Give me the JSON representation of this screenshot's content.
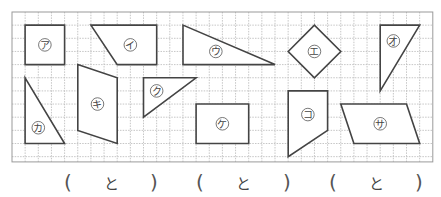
{
  "worksheet": {
    "grid": {
      "cols": 32,
      "rows": 11.4,
      "line_color": "#b8b8b8",
      "border_color": "#9a9a9a"
    },
    "shape_stroke": "#444444",
    "shapes": [
      {
        "label": "ア",
        "points": [
          [
            1,
            1
          ],
          [
            4,
            1
          ],
          [
            4,
            4
          ],
          [
            1,
            4
          ]
        ],
        "label_at": [
          2.5,
          2.5
        ]
      },
      {
        "label": "イ",
        "points": [
          [
            6,
            1
          ],
          [
            11,
            1
          ],
          [
            11,
            4
          ],
          [
            8,
            4
          ]
        ],
        "label_at": [
          9,
          2.5
        ]
      },
      {
        "label": "ウ",
        "points": [
          [
            13,
            1
          ],
          [
            13,
            4
          ],
          [
            20,
            4
          ]
        ],
        "label_at": [
          15.5,
          3
        ]
      },
      {
        "label": "エ",
        "points": [
          [
            21,
            3
          ],
          [
            23,
            1
          ],
          [
            25,
            3
          ],
          [
            23,
            5
          ]
        ],
        "label_at": [
          23,
          3
        ]
      },
      {
        "label": "オ",
        "points": [
          [
            28,
            1
          ],
          [
            31,
            1
          ],
          [
            28,
            6
          ]
        ],
        "label_at": [
          29,
          2.2
        ]
      },
      {
        "label": "カ",
        "points": [
          [
            1,
            5
          ],
          [
            1,
            10
          ],
          [
            4,
            10
          ]
        ],
        "label_at": [
          2,
          8.8
        ]
      },
      {
        "label": "キ",
        "points": [
          [
            5,
            4
          ],
          [
            8,
            5
          ],
          [
            8,
            10
          ],
          [
            5,
            9
          ]
        ],
        "label_at": [
          6.5,
          7
        ]
      },
      {
        "label": "ク",
        "points": [
          [
            10,
            5
          ],
          [
            14,
            5
          ],
          [
            10,
            8
          ]
        ],
        "label_at": [
          11,
          6
        ]
      },
      {
        "label": "ケ",
        "points": [
          [
            14,
            7
          ],
          [
            18,
            7
          ],
          [
            18,
            10
          ],
          [
            14,
            10
          ]
        ],
        "label_at": [
          16,
          8.5
        ]
      },
      {
        "label": "コ",
        "points": [
          [
            21,
            6
          ],
          [
            24,
            6
          ],
          [
            24,
            9
          ],
          [
            21,
            11
          ]
        ],
        "label_at": [
          22.5,
          7.8
        ]
      },
      {
        "label": "サ",
        "points": [
          [
            25,
            7
          ],
          [
            30,
            7
          ],
          [
            31,
            10
          ],
          [
            26,
            10
          ]
        ],
        "label_at": [
          28,
          8.5
        ]
      }
    ],
    "answers": [
      {
        "open": "(",
        "to": "と",
        "close": ")"
      },
      {
        "open": "(",
        "to": "と",
        "close": ")"
      },
      {
        "open": "(",
        "to": "と",
        "close": ")"
      }
    ]
  }
}
